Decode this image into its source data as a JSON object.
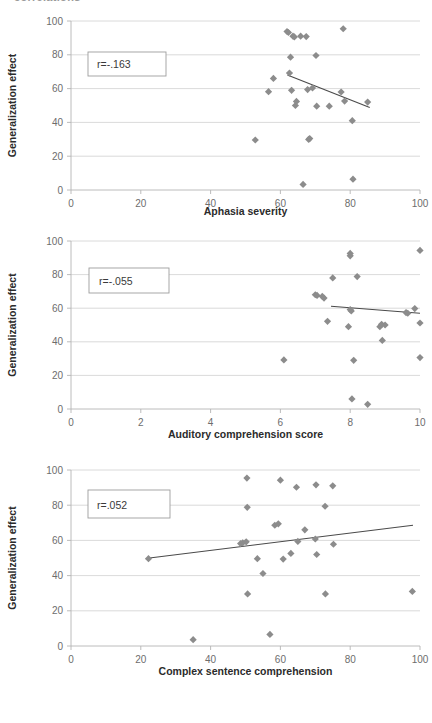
{
  "figure": {
    "top_cut_text": "correlations",
    "background": "#ffffff",
    "marker_color": "#8c8c8c",
    "grid_color": "#d0d0d0",
    "axis_color": "#b4b4b4",
    "trendline_color": "#4a4a4a"
  },
  "charts": [
    {
      "id": "chart-aphasia-severity",
      "annotation": "r=-.163",
      "chart_data": {
        "type": "scatter",
        "title": "",
        "xlabel": "Aphasia severity",
        "ylabel": "Generalization effect",
        "xlim": [
          0,
          100
        ],
        "ylim": [
          0,
          100
        ],
        "xticks": [
          0,
          20,
          40,
          60,
          80,
          100
        ],
        "yticks": [
          0,
          20,
          40,
          60,
          80,
          100
        ],
        "grid": true,
        "legend": "none",
        "annotations": [
          "r=-.163"
        ],
        "points": [
          [
            52.8,
            29.6
          ],
          [
            56.6,
            58.2
          ],
          [
            58.0,
            66.0
          ],
          [
            61.9,
            93.8
          ],
          [
            62.3,
            93.2
          ],
          [
            62.6,
            69.2
          ],
          [
            62.9,
            78.6
          ],
          [
            63.2,
            59.0
          ],
          [
            63.6,
            91.0
          ],
          [
            64.0,
            90.6
          ],
          [
            64.3,
            50.0
          ],
          [
            64.6,
            52.4
          ],
          [
            65.8,
            91.0
          ],
          [
            66.5,
            3.3
          ],
          [
            67.4,
            90.8
          ],
          [
            67.8,
            59.4
          ],
          [
            68.1,
            29.9
          ],
          [
            68.4,
            30.4
          ],
          [
            69.2,
            60.4
          ],
          [
            70.2,
            79.6
          ],
          [
            70.4,
            49.6
          ],
          [
            74.0,
            49.6
          ],
          [
            77.4,
            58.0
          ],
          [
            78.0,
            95.4
          ],
          [
            78.4,
            52.6
          ],
          [
            80.6,
            41.0
          ],
          [
            80.8,
            6.4
          ],
          [
            85.0,
            52.0
          ]
        ],
        "trendline": {
          "x": [
            62.0,
            85.6
          ],
          "y": [
            68.0,
            48.8
          ]
        }
      }
    },
    {
      "id": "chart-auditory-comprehension",
      "annotation": "r=-.055",
      "chart_data": {
        "type": "scatter",
        "title": "",
        "xlabel": "Auditory comprehension score",
        "ylabel": "Generalization effect",
        "xlim": [
          0,
          10
        ],
        "ylim": [
          0,
          100
        ],
        "xticks": [
          0,
          2,
          4,
          6,
          8,
          10
        ],
        "yticks": [
          0,
          20,
          40,
          60,
          80,
          100
        ],
        "grid": true,
        "legend": "none",
        "annotations": [
          "r=-.055"
        ],
        "points": [
          [
            6.1,
            29.2
          ],
          [
            7.0,
            68.0
          ],
          [
            7.05,
            67.6
          ],
          [
            7.2,
            67.0
          ],
          [
            7.25,
            66.0
          ],
          [
            7.35,
            52.2
          ],
          [
            7.5,
            78.0
          ],
          [
            7.95,
            49.0
          ],
          [
            8.0,
            92.6
          ],
          [
            8.0,
            91.2
          ],
          [
            8.0,
            59.2
          ],
          [
            8.03,
            58.4
          ],
          [
            8.05,
            6.0
          ],
          [
            8.1,
            29.0
          ],
          [
            8.2,
            78.8
          ],
          [
            8.5,
            2.8
          ],
          [
            8.85,
            49.0
          ],
          [
            8.9,
            50.4
          ],
          [
            8.92,
            40.8
          ],
          [
            9.0,
            50.0
          ],
          [
            9.6,
            57.4
          ],
          [
            9.65,
            57.0
          ],
          [
            9.85,
            59.8
          ],
          [
            10.0,
            94.4
          ],
          [
            10.0,
            51.2
          ],
          [
            10.0,
            30.6
          ]
        ],
        "trendline": {
          "x": [
            7.45,
            10.0
          ],
          "y": [
            61.2,
            57.0
          ]
        }
      }
    },
    {
      "id": "chart-complex-sentence-comprehension",
      "annotation": "r=.052",
      "chart_data": {
        "type": "scatter",
        "title": "",
        "xlabel": "Complex sentence comprehension",
        "ylabel": "Generalization effect",
        "xlim": [
          0,
          100
        ],
        "ylim": [
          0,
          100
        ],
        "xticks": [
          0,
          20,
          40,
          60,
          80,
          100
        ],
        "yticks": [
          0,
          20,
          40,
          60,
          80,
          100
        ],
        "grid": true,
        "legend": "none",
        "annotations": [
          "r=.052"
        ],
        "points": [
          [
            22.2,
            49.6
          ],
          [
            35.0,
            3.6
          ],
          [
            48.6,
            58.2
          ],
          [
            49.2,
            58.6
          ],
          [
            50.2,
            59.2
          ],
          [
            50.4,
            95.4
          ],
          [
            50.5,
            78.8
          ],
          [
            50.6,
            29.6
          ],
          [
            53.4,
            49.6
          ],
          [
            55.0,
            41.2
          ],
          [
            57.0,
            6.6
          ],
          [
            58.4,
            68.6
          ],
          [
            59.4,
            69.4
          ],
          [
            60.0,
            94.2
          ],
          [
            60.8,
            49.4
          ],
          [
            63.0,
            52.6
          ],
          [
            64.6,
            90.2
          ],
          [
            65.0,
            59.4
          ],
          [
            67.0,
            66.0
          ],
          [
            70.0,
            60.8
          ],
          [
            70.2,
            91.6
          ],
          [
            70.4,
            52.0
          ],
          [
            72.8,
            79.4
          ],
          [
            72.9,
            29.6
          ],
          [
            75.0,
            91.0
          ],
          [
            75.2,
            57.8
          ],
          [
            97.8,
            31.0
          ]
        ],
        "trendline": {
          "x": [
            22.5,
            98.0
          ],
          "y": [
            50.0,
            68.6
          ]
        }
      }
    }
  ]
}
